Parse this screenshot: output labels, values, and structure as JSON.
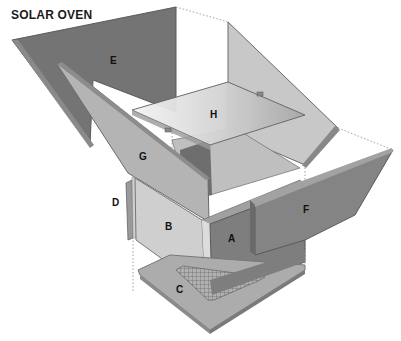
{
  "title": "SOLAR OVEN",
  "labels": {
    "A": "A",
    "B": "B",
    "C": "C",
    "D": "D",
    "E": "E",
    "F": "F",
    "G": "G",
    "H": "H"
  },
  "colors": {
    "dark_panel": "#747474",
    "mid_panel": "#9a9a9a",
    "light_panel": "#c4c4c4",
    "base": "#aaaaaa",
    "edge": "#5a5a5a"
  }
}
